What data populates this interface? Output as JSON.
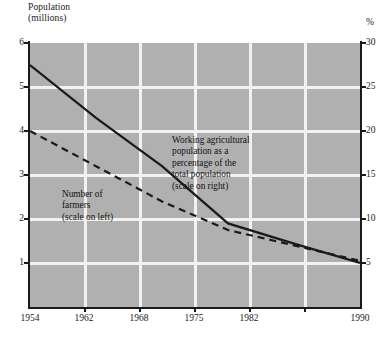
{
  "chart_data": {
    "type": "line",
    "title": "",
    "x": [
      1954,
      1962,
      1968,
      1975,
      1982,
      1990
    ],
    "xlabel": "",
    "x_tick_labels": [
      "1954",
      "1962",
      "1968",
      "1975",
      "1982",
      "1990"
    ],
    "grid": true,
    "legend": "inline-annotations",
    "axes": {
      "left": {
        "label": "Population\n(millions)",
        "ticks": [
          6,
          5,
          4,
          3,
          2,
          1
        ],
        "tick_labels": [
          "6",
          "5",
          "4",
          "3",
          "2",
          "1"
        ],
        "ylim": [
          0,
          6
        ],
        "unit": "millions"
      },
      "right": {
        "label": "%",
        "ticks": [
          30,
          25,
          20,
          15,
          10,
          5
        ],
        "tick_labels": [
          "30",
          "25",
          "20",
          "15",
          "10",
          "5"
        ],
        "ylim": [
          0,
          30
        ],
        "unit": "%"
      }
    },
    "series": [
      {
        "name": "Working agricultural population as a percentage of the total population (scale on right)",
        "style": "solid",
        "axis": "right",
        "color": "#1a1a1a",
        "x": [
          1954,
          1962,
          1968,
          1975,
          1982,
          1990
        ],
        "values": [
          27.5,
          21.5,
          16.0,
          9.5,
          7.2,
          5.0
        ]
      },
      {
        "name": "Number of farmers (scale on left)",
        "style": "dashed",
        "axis": "left",
        "color": "#1a1a1a",
        "x": [
          1954,
          1962,
          1968,
          1975,
          1982,
          1990
        ],
        "values": [
          4.0,
          3.2,
          2.4,
          1.75,
          1.4,
          1.05
        ]
      }
    ],
    "annotations": [
      {
        "id": "percentage-note",
        "text": "Working agricultural\npopulation as a\npercentage of the\ntotal population\n(scale on right)"
      },
      {
        "id": "farmers-note",
        "text": "Number of\nfarmers\n(scale on left)"
      }
    ]
  },
  "axis_titles": {
    "left": "Population\n(millions)",
    "right": "%"
  },
  "ticks": {
    "left": [
      "6",
      "5",
      "4",
      "3",
      "2",
      "1"
    ],
    "right": [
      "30",
      "25",
      "20",
      "15",
      "10",
      "5"
    ],
    "x": [
      "1954",
      "1962",
      "1968",
      "1975",
      "1982",
      "1990"
    ]
  },
  "annotations": {
    "percentage": "Working agricultural\npopulation as a\npercentage of the\ntotal population\n(scale on right)",
    "farmers": "Number of\nfarmers\n(scale on left)"
  },
  "colors": {
    "plot_background": "#b0b0b0",
    "gridline": "#f2f2f2",
    "line": "#1a1a1a",
    "page_background": "#ffffff"
  }
}
